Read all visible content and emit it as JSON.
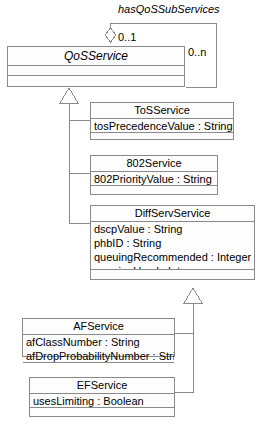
{
  "diagram": {
    "type": "uml-class-diagram",
    "width": 259,
    "height": 424,
    "background": "#ffffff",
    "line_color": "#8a8a8a",
    "text_color": "#000000"
  },
  "association": {
    "name": "hasQoSSubServices",
    "source_multiplicity": "0..1",
    "target_multiplicity": "0..n",
    "aggregation": "shared-diamond"
  },
  "classes": {
    "qos_service": {
      "name": "QoSService",
      "abstract": true,
      "attributes": [],
      "operations": []
    },
    "tos_service": {
      "name": "ToSService",
      "abstract": false,
      "attributes": [
        "tosPrecedenceValue : String"
      ],
      "operations": []
    },
    "service_802": {
      "name": "802Service",
      "abstract": false,
      "attributes": [
        "802PriorityValue : String"
      ],
      "operations": []
    },
    "diffserv_service": {
      "name": "DiffServService",
      "abstract": false,
      "attributes": [
        "dscpValue : String",
        "phbID : String",
        "queuingRecommended : Integer",
        "queuingUsed : Integer"
      ],
      "operations": []
    },
    "af_service": {
      "name": "AFService",
      "abstract": false,
      "attributes": [
        "afClassNumber : String",
        "afDropProbabilityNumber : String"
      ],
      "operations": []
    },
    "ef_service": {
      "name": "EFService",
      "abstract": false,
      "attributes": [
        "usesLimiting : Boolean"
      ],
      "operations": []
    }
  },
  "generalizations": [
    {
      "parent": "QoSService",
      "child": "ToSService"
    },
    {
      "parent": "QoSService",
      "child": "802Service"
    },
    {
      "parent": "QoSService",
      "child": "DiffServService"
    },
    {
      "parent": "DiffServService",
      "child": "AFService"
    },
    {
      "parent": "DiffServService",
      "child": "EFService"
    }
  ]
}
